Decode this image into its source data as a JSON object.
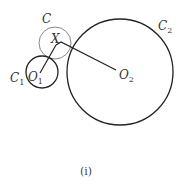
{
  "figure": {
    "caption": "(i)",
    "labels": {
      "C": "C",
      "C1_main": "C",
      "C1_sub": "1",
      "C2_main": "C",
      "C2_sub": "2",
      "X": "X",
      "O1_main": "O",
      "O1_sub": "1",
      "O2_main": "O",
      "O2_sub": "2"
    },
    "circles": [
      {
        "name": "C",
        "cx": 55,
        "cy": 43,
        "r": 16,
        "color": "#888888"
      },
      {
        "name": "C1",
        "cx": 42,
        "cy": 72,
        "r": 16,
        "color": "#222222"
      },
      {
        "name": "C2",
        "cx": 120,
        "cy": 72,
        "r": 53,
        "color": "#222222"
      }
    ],
    "points": {
      "X": [
        56,
        35
      ],
      "O1": [
        40,
        75
      ],
      "O2": [
        117,
        72
      ]
    }
  }
}
